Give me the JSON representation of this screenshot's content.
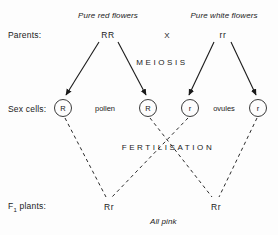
{
  "diagram": {
    "title_rows": {
      "parents_label": "Parents:",
      "sex_cells_label": "Sex cells:",
      "f1_label_prefix": "F",
      "f1_label_subscript": "1",
      "f1_label_suffix": " plants:"
    },
    "parents": {
      "left_caption": "Pure red flowers",
      "left_genotype": "RR",
      "cross_symbol": "X",
      "right_caption": "Pure white flowers",
      "right_genotype": "rr"
    },
    "stages": {
      "meiosis": "MEIOSIS",
      "fertilisation": "FERTILISATION"
    },
    "gametes": {
      "pollen_label": "pollen",
      "ovules_label": "ovules",
      "cells": [
        {
          "allele": "R"
        },
        {
          "allele": "R"
        },
        {
          "allele": "r"
        },
        {
          "allele": "r"
        }
      ]
    },
    "offspring": {
      "left_genotype": "Rr",
      "right_genotype": "Rr",
      "phenotype_caption": "All pink"
    },
    "colors": {
      "ink": "#1a1a1a",
      "stroke": "#3a3a3a",
      "background": "#fdfdfd"
    }
  }
}
